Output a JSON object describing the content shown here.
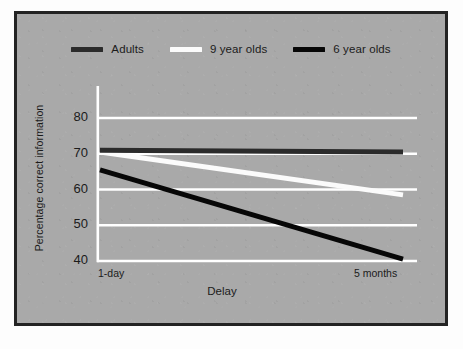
{
  "figure": {
    "background_color": "#a9a9a9",
    "border_color": "#232323",
    "page_color": "#fdfdfd",
    "grid_color": "#ffffff",
    "axis_color": "#ffffff"
  },
  "legend": {
    "position": "top-center",
    "entries": [
      {
        "label": "Adults",
        "color": "#2b2b2b",
        "swatch": "adults-swatch"
      },
      {
        "label": "9 year olds",
        "color": "#fbfbfb",
        "swatch": "nine-year-olds-swatch"
      },
      {
        "label": "6 year olds",
        "color": "#070707",
        "swatch": "six-year-olds-swatch"
      }
    ]
  },
  "axes": {
    "y_title": "Percentage correct information",
    "x_title": "Delay",
    "y_ticks": [
      "80",
      "70",
      "60",
      "50",
      "40"
    ],
    "x_ticks": [
      "1-day",
      "5 months"
    ]
  },
  "chart_data": {
    "type": "line",
    "title": "",
    "xlabel": "Delay",
    "ylabel": "Percentage correct information",
    "categories": [
      "1-day",
      "5 months"
    ],
    "x": [
      0,
      1
    ],
    "ylim": [
      40,
      80
    ],
    "xlim": [
      0,
      1
    ],
    "grid": true,
    "grid_axis": "y",
    "gridlines": [
      80,
      70,
      60,
      50,
      40
    ],
    "legend_position": "top-center",
    "series": [
      {
        "name": "Adults",
        "color": "#2b2b2b",
        "line_width": 5,
        "values": [
          71.0,
          70.5
        ]
      },
      {
        "name": "9 year olds",
        "color": "#fbfbfb",
        "line_width": 5,
        "values": [
          70.5,
          58.5
        ]
      },
      {
        "name": "6 year olds",
        "color": "#070707",
        "line_width": 5,
        "values": [
          65.5,
          40.5
        ]
      }
    ]
  }
}
